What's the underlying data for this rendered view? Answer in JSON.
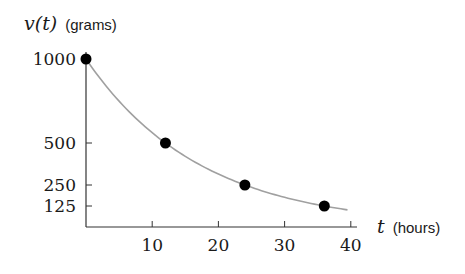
{
  "chart_data": {
    "type": "scatter",
    "title": "",
    "xlabel": "t (hours)",
    "ylabel": "v(t) (grams)",
    "xlabel_var": "t",
    "xlabel_unit": "(hours)",
    "ylabel_var": "v(t)",
    "ylabel_unit": "(grams)",
    "xlim": [
      0,
      41
    ],
    "ylim": [
      0,
      1060
    ],
    "x_ticks": [
      10,
      20,
      30,
      40
    ],
    "x_tick_labels": [
      "10",
      "20",
      "30",
      "40"
    ],
    "y_ticks": [
      125,
      250,
      500,
      1000
    ],
    "y_tick_labels": [
      "125",
      "250",
      "500",
      "1000"
    ],
    "grid": false,
    "legend": null,
    "series": [
      {
        "name": "measurements",
        "kind": "points",
        "color": "#000000",
        "x": [
          0,
          12,
          24,
          36
        ],
        "y": [
          1000,
          500,
          250,
          125
        ]
      },
      {
        "name": "decay curve",
        "kind": "line",
        "color": "#a0a0a0",
        "formula": "1000 * 0.5^(t/12)",
        "x_range": [
          0,
          39.5
        ]
      }
    ]
  }
}
